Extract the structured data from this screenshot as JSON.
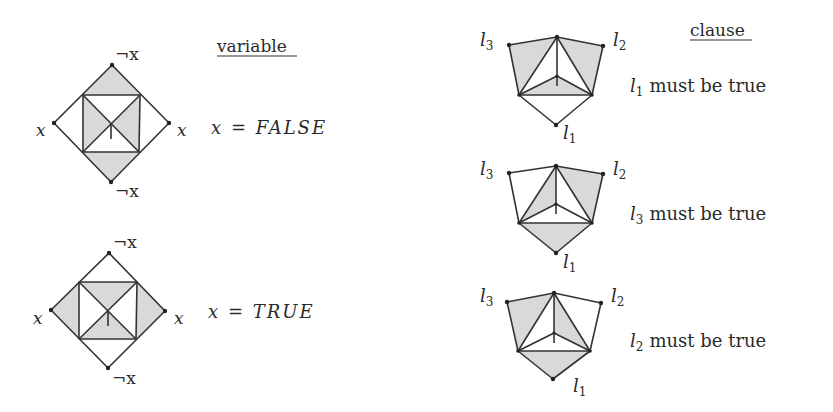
{
  "variable_panel": {
    "heading": "variable",
    "neg_label": "¬x",
    "pos_label": "x",
    "gadgets": [
      {
        "state_var": "x",
        "state_eq": "=",
        "state_value": "FALSE",
        "shaded": "top-bottom-triangles-and-left-right-inner-triangles"
      },
      {
        "state_var": "x",
        "state_eq": "=",
        "state_value": "TRUE",
        "shaded": "left-right-triangles-and-top-bottom-inner-triangles"
      }
    ]
  },
  "clause_panel": {
    "heading": "clause",
    "literals": {
      "l1": "l",
      "l1_sub": "1",
      "l2": "l",
      "l2_sub": "2",
      "l3": "l",
      "l3_sub": "3"
    },
    "gadgets": [
      {
        "lit": "l",
        "sub": "1",
        "text": "must be true"
      },
      {
        "lit": "l",
        "sub": "3",
        "text": "must be true"
      },
      {
        "lit": "l",
        "sub": "2",
        "text": "must be true"
      }
    ]
  },
  "colors": {
    "line": "#333333",
    "shade": "#d9d9d9",
    "text": "#2a2a2a"
  }
}
